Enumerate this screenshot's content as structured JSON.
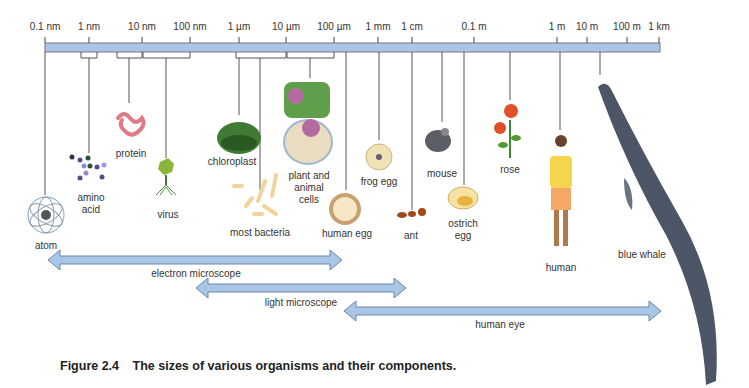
{
  "scale": {
    "ticks": [
      {
        "label": "0.1 nm",
        "x": 45
      },
      {
        "label": "1 nm",
        "x": 89
      },
      {
        "label": "10 nm",
        "x": 142
      },
      {
        "label": "100 nm",
        "x": 190
      },
      {
        "label": "1 µm",
        "x": 239
      },
      {
        "label": "10 µm",
        "x": 286
      },
      {
        "label": "100 µm",
        "x": 334
      },
      {
        "label": "1 mm",
        "x": 378
      },
      {
        "label": "1 cm",
        "x": 412
      },
      {
        "label": "0.1 m",
        "x": 474
      },
      {
        "label": "1 m",
        "x": 557
      },
      {
        "label": "10 m",
        "x": 587
      },
      {
        "label": "100 m",
        "x": 627
      },
      {
        "label": "1 km",
        "x": 659
      }
    ],
    "bar_color": "#a9c6e8",
    "bar_border": "#777777"
  },
  "items": [
    {
      "label": "atom",
      "x": 44
    },
    {
      "label": "amino\nacid",
      "x": 91
    },
    {
      "label": "protein",
      "x": 131
    },
    {
      "label": "virus",
      "x": 168
    },
    {
      "label": "chloroplast",
      "x": 232
    },
    {
      "label": "most bacteria",
      "x": 260
    },
    {
      "label": "plant and\nanimal\ncells",
      "x": 311
    },
    {
      "label": "human egg",
      "x": 348
    },
    {
      "label": "frog egg",
      "x": 380
    },
    {
      "label": "ant",
      "x": 412
    },
    {
      "label": "mouse",
      "x": 443
    },
    {
      "label": "ostrich\negg",
      "x": 464
    },
    {
      "label": "rose",
      "x": 510
    },
    {
      "label": "human",
      "x": 561
    },
    {
      "label": "blue whale",
      "x": 642
    }
  ],
  "ranges": [
    {
      "label": "electron microscope",
      "x1": 48,
      "x2": 342,
      "y": 260
    },
    {
      "label": "light microscope",
      "x1": 196,
      "x2": 406,
      "y": 288
    },
    {
      "label": "human eye",
      "x1": 344,
      "x2": 661,
      "y": 311
    }
  ],
  "caption": {
    "number": "Figure 2.4",
    "text": "The sizes of various organisms and their components."
  }
}
